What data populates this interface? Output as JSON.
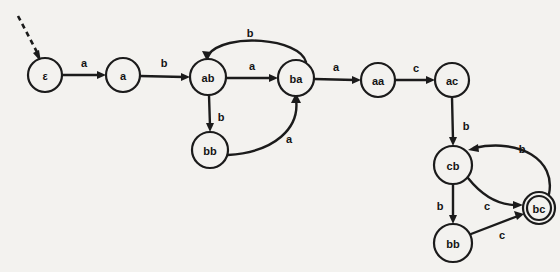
{
  "diagram": {
    "background_color": "#f3f2ef",
    "stroke_color": "#1b1b1b",
    "start_marker": "dashed-incoming-arrow",
    "nodes": [
      {
        "id": "eps",
        "label": "ε",
        "cx": 45,
        "cy": 75,
        "r": 17,
        "accepting": false
      },
      {
        "id": "a",
        "label": "a",
        "cx": 123,
        "cy": 75,
        "r": 17,
        "accepting": false
      },
      {
        "id": "ab",
        "label": "ab",
        "cx": 208,
        "cy": 77,
        "r": 18,
        "accepting": false
      },
      {
        "id": "ba",
        "label": "ba",
        "cx": 296,
        "cy": 78,
        "r": 18,
        "accepting": false
      },
      {
        "id": "aa",
        "label": "aa",
        "cx": 378,
        "cy": 80,
        "r": 17,
        "accepting": false
      },
      {
        "id": "ac",
        "label": "ac",
        "cx": 452,
        "cy": 80,
        "r": 17,
        "accepting": false
      },
      {
        "id": "bb1",
        "label": "bb",
        "cx": 210,
        "cy": 150,
        "r": 18,
        "accepting": false
      },
      {
        "id": "cb",
        "label": "cb",
        "cx": 453,
        "cy": 165,
        "r": 19,
        "accepting": false
      },
      {
        "id": "bb2",
        "label": "bb",
        "cx": 453,
        "cy": 243,
        "r": 19,
        "accepting": false
      },
      {
        "id": "bc",
        "label": "bc",
        "cx": 539,
        "cy": 208,
        "r": 16,
        "accepting": true
      }
    ],
    "edges": [
      {
        "from": "eps",
        "to": "a",
        "label": "a",
        "label_x": 84,
        "label_y": 63,
        "shape": "straight"
      },
      {
        "from": "a",
        "to": "ab",
        "label": "b",
        "label_x": 164,
        "label_y": 63,
        "shape": "straight"
      },
      {
        "from": "ab",
        "to": "ba",
        "label": "a",
        "label_x": 252,
        "label_y": 66,
        "shape": "straight"
      },
      {
        "from": "ba",
        "to": "ab",
        "label": "b",
        "label_x": 250,
        "label_y": 33,
        "shape": "curve-above"
      },
      {
        "from": "ab",
        "to": "bb1",
        "label": "b",
        "label_x": 221,
        "label_y": 117,
        "shape": "straight"
      },
      {
        "from": "bb1",
        "to": "ba",
        "label": "a",
        "label_x": 289,
        "label_y": 139,
        "shape": "curve-right"
      },
      {
        "from": "ba",
        "to": "aa",
        "label": "a",
        "label_x": 336,
        "label_y": 67,
        "shape": "straight"
      },
      {
        "from": "aa",
        "to": "ac",
        "label": "c",
        "label_x": 416,
        "label_y": 68,
        "shape": "straight"
      },
      {
        "from": "ac",
        "to": "cb",
        "label": "b",
        "label_x": 466,
        "label_y": 126,
        "shape": "straight"
      },
      {
        "from": "cb",
        "to": "bb2",
        "label": "b",
        "label_x": 440,
        "label_y": 206,
        "shape": "straight"
      },
      {
        "from": "cb",
        "to": "bc",
        "label": "c",
        "label_x": 487,
        "label_y": 206,
        "shape": "curve-down"
      },
      {
        "from": "bc",
        "to": "cb",
        "label": "b",
        "label_x": 522,
        "label_y": 149,
        "shape": "curve-up"
      },
      {
        "from": "bb2",
        "to": "bc",
        "label": "c",
        "label_x": 502,
        "label_y": 235,
        "shape": "straight"
      }
    ],
    "alphabet": [
      "a",
      "b",
      "c"
    ]
  }
}
